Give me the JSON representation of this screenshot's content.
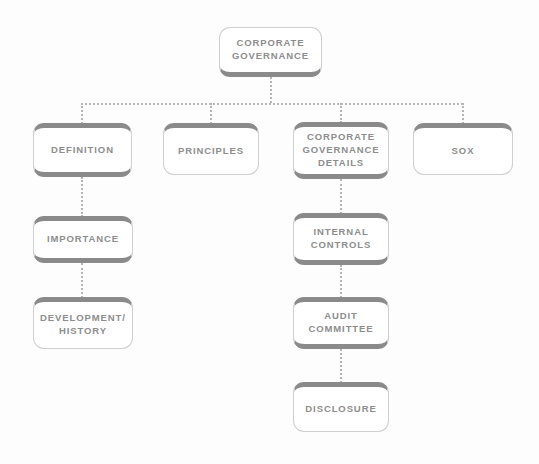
{
  "diagram": {
    "type": "tree",
    "colors": {
      "background": "#fdfdfd",
      "node_fill": "#ffffff",
      "node_outline": "#cfcfcf",
      "node_accent_bar": "#8a8a8a",
      "text": "#8d8d8d",
      "connector": "#b4b4b4"
    },
    "nodes": [
      {
        "id": "corporate-governance",
        "label": "CORPORATE\nGOVERNANCE",
        "level": 0,
        "x": 219,
        "y": 27,
        "w": 103,
        "h": 50,
        "caps": [
          "bottom"
        ]
      },
      {
        "id": "definition",
        "label": "DEFINITION",
        "level": 1,
        "x": 33,
        "y": 123,
        "w": 99,
        "h": 54,
        "caps": [
          "top",
          "bottom"
        ]
      },
      {
        "id": "principles",
        "label": "PRINCIPLES",
        "level": 1,
        "x": 163,
        "y": 123,
        "w": 96,
        "h": 52,
        "caps": [
          "top"
        ]
      },
      {
        "id": "corporate-governance-details",
        "label": "CORPORATE\nGOVERNANCE\nDETAILS",
        "level": 1,
        "x": 293,
        "y": 122,
        "w": 96,
        "h": 57,
        "caps": [
          "top",
          "bottom"
        ]
      },
      {
        "id": "sox",
        "label": "SOX",
        "level": 1,
        "x": 413,
        "y": 123,
        "w": 100,
        "h": 52,
        "caps": [
          "top"
        ]
      },
      {
        "id": "importance",
        "label": "IMPORTANCE",
        "level": 2,
        "x": 33,
        "y": 216,
        "w": 100,
        "h": 47,
        "caps": [
          "top",
          "bottom"
        ]
      },
      {
        "id": "development-history",
        "label": "DEVELOPMENT/\nHISTORY",
        "level": 3,
        "x": 33,
        "y": 297,
        "w": 100,
        "h": 52,
        "caps": [
          "top"
        ]
      },
      {
        "id": "internal-controls",
        "label": "INTERNAL\nCONTROLS",
        "level": 2,
        "x": 293,
        "y": 213,
        "w": 96,
        "h": 52,
        "caps": [
          "top",
          "bottom"
        ]
      },
      {
        "id": "audit-committee",
        "label": "AUDIT\nCOMMITTEE",
        "level": 3,
        "x": 293,
        "y": 297,
        "w": 96,
        "h": 52,
        "caps": [
          "top",
          "bottom"
        ]
      },
      {
        "id": "disclosure",
        "label": "DISCLOSURE",
        "level": 4,
        "x": 293,
        "y": 382,
        "w": 96,
        "h": 50,
        "caps": [
          "top"
        ]
      }
    ],
    "connectors": {
      "verticals": [
        {
          "id": "root-stem",
          "x": 270,
          "y": 77,
          "len": 26
        },
        {
          "id": "bus-to-definition",
          "x": 81,
          "y": 103,
          "len": 21
        },
        {
          "id": "bus-to-principles",
          "x": 210,
          "y": 103,
          "len": 21
        },
        {
          "id": "bus-to-details",
          "x": 340,
          "y": 103,
          "len": 20
        },
        {
          "id": "bus-to-sox",
          "x": 462,
          "y": 103,
          "len": 21
        },
        {
          "id": "definition-to-importance",
          "x": 81,
          "y": 177,
          "len": 40
        },
        {
          "id": "importance-to-development",
          "x": 81,
          "y": 263,
          "len": 35
        },
        {
          "id": "details-to-internal-controls",
          "x": 340,
          "y": 179,
          "len": 35
        },
        {
          "id": "internal-controls-to-audit",
          "x": 340,
          "y": 265,
          "len": 33
        },
        {
          "id": "audit-to-disclosure",
          "x": 340,
          "y": 349,
          "len": 34
        }
      ],
      "horizontals": [
        {
          "id": "level1-bus",
          "x": 81,
          "y": 103,
          "len": 382
        }
      ]
    }
  }
}
